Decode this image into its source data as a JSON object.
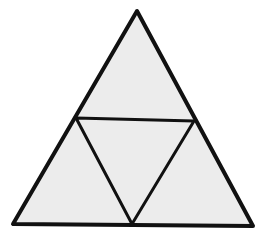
{
  "diagram": {
    "type": "subdivided-triangle",
    "colors": {
      "background": "#ffffff",
      "fill": "#ececec",
      "stroke": "#111111"
    },
    "outer_triangle": {
      "apex": [
        137,
        11
      ],
      "bottom_left": [
        13,
        224
      ],
      "bottom_right": [
        253,
        226
      ]
    },
    "midpoints": {
      "left": [
        76,
        118
      ],
      "right": [
        194,
        121
      ],
      "bottom": [
        132,
        224
      ]
    },
    "sub_triangle_count": 4
  }
}
